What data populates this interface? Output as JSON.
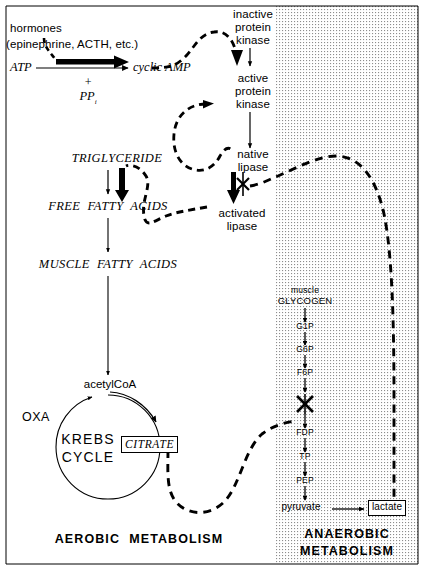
{
  "figure": {
    "ink_color": "#000000",
    "background_color": "#ffffff",
    "stipple_color": "#9a9a9a"
  },
  "hormone_block": {
    "line1": "hormones",
    "line2": "(epinephrine, ACTH, etc.)",
    "substrate": "ATP",
    "product": "cyclic AMP",
    "plus": "+",
    "byproduct": "PP",
    "byproduct_subscript": "i"
  },
  "kinase_cascade": {
    "inactive": [
      "inactive",
      "protein",
      "kinase"
    ],
    "active": [
      "active",
      "protein",
      "kinase"
    ],
    "native_lipase": [
      "native",
      "lipase"
    ],
    "activated_lipase": [
      "activated",
      "lipase"
    ]
  },
  "lipid_pathway": {
    "steps": [
      "TRIGLYCERIDE",
      "FREE  FATTY  ACIDS",
      "MUSCLE  FATTY  ACIDS"
    ],
    "acetylcoa": "acetylCoA"
  },
  "krebs": {
    "name_line1": "KREBS",
    "name_line2": "CYCLE",
    "oxaloacetate": "OXA",
    "citrate": "CITRATE"
  },
  "glycolysis": {
    "source_qualifier": "muscle",
    "source": "GLYCOGEN",
    "intermediates": [
      "G1P",
      "G6P",
      "F6P",
      "FDP",
      "TP",
      "PEP"
    ],
    "end_product": "pyruvate",
    "terminal_product": "lactate"
  },
  "footers": {
    "aerobic": "AEROBIC  METABOLISM",
    "anaerobic_line1": "ANAEROBIC",
    "anaerobic_line2": "METABOLISM"
  },
  "markers": {
    "inhibition_symbol": "X",
    "inhibition_count": 2,
    "inhibition_targets": [
      "native lipase to activated lipase",
      "F6P to FDP"
    ]
  }
}
